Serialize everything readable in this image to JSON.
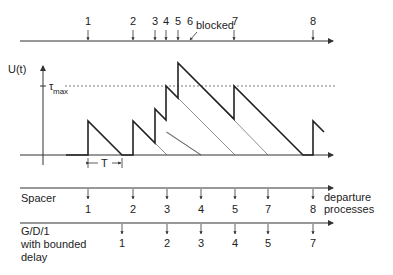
{
  "arrivals": {
    "labels": [
      "1",
      "2",
      "3",
      "4",
      "5",
      "6",
      "7",
      "8"
    ],
    "blocked_label": "blocked"
  },
  "plot": {
    "y_axis_label": "U(t)",
    "tau_label": "τ",
    "tau_sub": "max",
    "period_label": "T"
  },
  "spacer": {
    "label": "Spacer",
    "departures": [
      "1",
      "2",
      "3",
      "4",
      "5",
      "7",
      "8"
    ]
  },
  "departure_caption": [
    "departure",
    "processes"
  ],
  "gd1": {
    "label_lines": [
      "G/D/1",
      "with bounded",
      "delay"
    ],
    "departures": [
      "1",
      "2",
      "3",
      "4",
      "5",
      "7"
    ]
  }
}
